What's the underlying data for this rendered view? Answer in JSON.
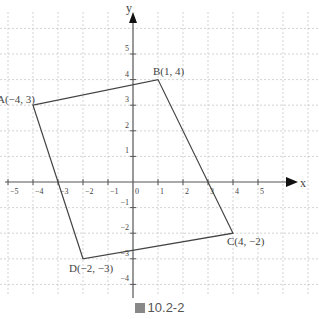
{
  "figure": {
    "caption_prefix_icon": "figure-box-icon",
    "caption": "圖 10.2-2",
    "axis_x_label": "x",
    "axis_y_label": "y",
    "origin_label": "0",
    "x_ticks": [
      -5,
      -4,
      -3,
      -2,
      -1,
      1,
      2,
      3,
      4,
      5
    ],
    "y_ticks": [
      -4,
      -3,
      -2,
      -1,
      1,
      2,
      3,
      4,
      5
    ],
    "points": [
      {
        "name": "A",
        "x": -4,
        "y": 3,
        "label": "A(−4, 3)"
      },
      {
        "name": "B",
        "x": 1,
        "y": 4,
        "label": "B(1, 4)"
      },
      {
        "name": "C",
        "x": 4,
        "y": -2,
        "label": "C(4, −2)"
      },
      {
        "name": "D",
        "x": -2,
        "y": -3,
        "label": "D(−2, −3)"
      }
    ],
    "colors": {
      "axis": "#555555",
      "grid": "#c8c8c8",
      "shape": "#444444",
      "text": "#444444"
    }
  }
}
